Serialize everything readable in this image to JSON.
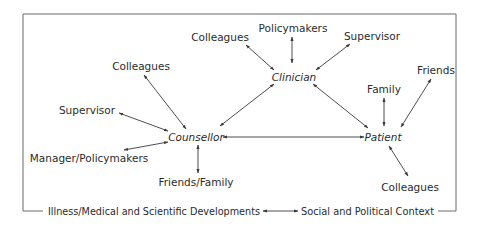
{
  "diagram": {
    "type": "relationship-network",
    "central_nodes": {
      "clinician": "Clinician",
      "counsellor": "Counsellor",
      "patient": "Patient"
    },
    "clinician_links": {
      "colleagues": "Colleagues",
      "policymakers": "Policymakers",
      "supervisor": "Supervisor"
    },
    "counsellor_links": {
      "colleagues": "Colleagues",
      "supervisor": "Supervisor",
      "manager_policymakers": "Manager/Policymakers",
      "friends_family": "Friends/Family"
    },
    "patient_links": {
      "family": "Family",
      "friends": "Friends",
      "colleagues": "Colleagues"
    },
    "context": {
      "left": "Illness/Medical and Scientific Developments",
      "right": "Social and Political Context"
    },
    "edges": [
      {
        "from": "Clinician",
        "to": "Colleagues",
        "bidirectional": true
      },
      {
        "from": "Clinician",
        "to": "Policymakers",
        "bidirectional": true
      },
      {
        "from": "Clinician",
        "to": "Supervisor",
        "bidirectional": true
      },
      {
        "from": "Clinician",
        "to": "Counsellor",
        "bidirectional": true
      },
      {
        "from": "Clinician",
        "to": "Patient",
        "bidirectional": true
      },
      {
        "from": "Counsellor",
        "to": "Colleagues",
        "bidirectional": true
      },
      {
        "from": "Counsellor",
        "to": "Supervisor",
        "bidirectional": true
      },
      {
        "from": "Counsellor",
        "to": "Manager/Policymakers",
        "bidirectional": true
      },
      {
        "from": "Counsellor",
        "to": "Friends/Family",
        "bidirectional": true
      },
      {
        "from": "Counsellor",
        "to": "Patient",
        "bidirectional": true
      },
      {
        "from": "Patient",
        "to": "Family",
        "bidirectional": true
      },
      {
        "from": "Patient",
        "to": "Friends",
        "bidirectional": true
      },
      {
        "from": "Patient",
        "to": "Colleagues",
        "bidirectional": true
      },
      {
        "from": "Illness/Medical and Scientific Developments",
        "to": "Social and Political Context",
        "bidirectional": true
      }
    ]
  }
}
